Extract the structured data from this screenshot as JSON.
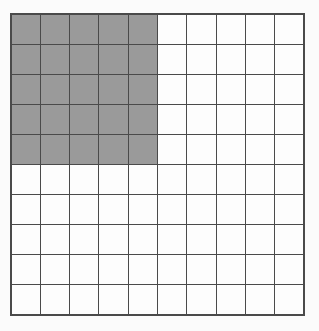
{
  "figure": {
    "type": "shaded-grid",
    "rows": 10,
    "columns": 10,
    "total_cells": 100,
    "shaded_cells": 25,
    "unshaded_cells": 75,
    "shaded_fraction": "25/100",
    "shaded_percent": 25,
    "shaded_region": {
      "start_row": 1,
      "end_row": 5,
      "start_column": 1,
      "end_column": 5,
      "row_count": 5,
      "column_count": 5
    },
    "colors": {
      "shaded_fill": "#9a9a9a",
      "unshaded_fill": "#fdfdfd",
      "grid_line": "#4a4a4a",
      "outer_border": "#4a4a4a",
      "page_background": "#fbfbfb"
    },
    "cell_states": [
      [
        "shaded",
        "shaded",
        "shaded",
        "shaded",
        "shaded",
        "empty",
        "empty",
        "empty",
        "empty",
        "empty"
      ],
      [
        "shaded",
        "shaded",
        "shaded",
        "shaded",
        "shaded",
        "empty",
        "empty",
        "empty",
        "empty",
        "empty"
      ],
      [
        "shaded",
        "shaded",
        "shaded",
        "shaded",
        "shaded",
        "empty",
        "empty",
        "empty",
        "empty",
        "empty"
      ],
      [
        "shaded",
        "shaded",
        "shaded",
        "shaded",
        "shaded",
        "empty",
        "empty",
        "empty",
        "empty",
        "empty"
      ],
      [
        "shaded",
        "shaded",
        "shaded",
        "shaded",
        "shaded",
        "empty",
        "empty",
        "empty",
        "empty",
        "empty"
      ],
      [
        "empty",
        "empty",
        "empty",
        "empty",
        "empty",
        "empty",
        "empty",
        "empty",
        "empty",
        "empty"
      ],
      [
        "empty",
        "empty",
        "empty",
        "empty",
        "empty",
        "empty",
        "empty",
        "empty",
        "empty",
        "empty"
      ],
      [
        "empty",
        "empty",
        "empty",
        "empty",
        "empty",
        "empty",
        "empty",
        "empty",
        "empty",
        "empty"
      ],
      [
        "empty",
        "empty",
        "empty",
        "empty",
        "empty",
        "empty",
        "empty",
        "empty",
        "empty",
        "empty"
      ],
      [
        "empty",
        "empty",
        "empty",
        "empty",
        "empty",
        "empty",
        "empty",
        "empty",
        "empty",
        "empty"
      ]
    ]
  }
}
